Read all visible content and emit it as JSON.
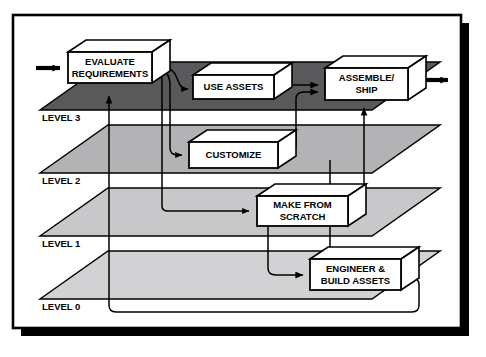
{
  "diagram": {
    "frame": {
      "x": 13,
      "y": 15,
      "width": 448,
      "height": 313,
      "border_color": "#000000",
      "shadow_color": "#000000",
      "fill_color": "#ffffff"
    },
    "colors": {
      "ink": "#000000",
      "paper": "#ffffff",
      "level3_plane": "#59595b",
      "level2_plane": "#b3b3b5",
      "level1_plane": "#c8c8ca",
      "level0_plane": "#d2d2d4",
      "box_face": "#ffffff"
    },
    "levels": [
      {
        "id": "level-3",
        "label": "LEVEL 3",
        "label_x": 42,
        "label_y": 118,
        "plane_fill": "#59595b",
        "plane_points": "40,110 108,62 440,62 372,110"
      },
      {
        "id": "level-2",
        "label": "LEVEL 2",
        "label_x": 42,
        "label_y": 181,
        "plane_fill": "#b3b3b5",
        "plane_points": "40,173 108,125 440,125 372,173"
      },
      {
        "id": "level-1",
        "label": "LEVEL 1",
        "label_x": 42,
        "label_y": 244,
        "plane_fill": "#c8c8ca",
        "plane_points": "40,236 108,188 440,188 372,236"
      },
      {
        "id": "level-0",
        "label": "LEVEL 0",
        "label_x": 42,
        "label_y": 307,
        "plane_fill": "#d2d2d4",
        "plane_points": "40,299 108,251 440,251 372,299"
      }
    ],
    "boxes": [
      {
        "id": "evaluate-requirements",
        "lines": [
          "EVALUATE",
          "REQUIREMENTS"
        ],
        "x": 68,
        "y": 52,
        "width": 84,
        "height": 31,
        "depth_x": 18,
        "depth_y": -12,
        "font_size": 9.5,
        "level": "level-3"
      },
      {
        "id": "use-assets",
        "lines": [
          "USE ASSETS"
        ],
        "x": 193,
        "y": 75,
        "width": 81,
        "height": 24,
        "depth_x": 18,
        "depth_y": -12,
        "font_size": 9.5,
        "level": "level-3"
      },
      {
        "id": "assemble-ship",
        "lines": [
          "ASSEMBLE/",
          "SHIP"
        ],
        "x": 325,
        "y": 68,
        "width": 83,
        "height": 32,
        "depth_x": 18,
        "depth_y": -12,
        "font_size": 9.5,
        "level": "level-3"
      },
      {
        "id": "customize",
        "lines": [
          "CUSTOMIZE"
        ],
        "x": 189,
        "y": 142,
        "width": 89,
        "height": 26,
        "depth_x": 18,
        "depth_y": -12,
        "font_size": 9.5,
        "level": "level-2"
      },
      {
        "id": "make-from-scratch",
        "lines": [
          "MAKE FROM",
          "SCRATCH"
        ],
        "x": 257,
        "y": 196,
        "width": 91,
        "height": 30,
        "depth_x": 18,
        "depth_y": -12,
        "font_size": 9.5,
        "level": "level-1"
      },
      {
        "id": "engineer-build-assets",
        "lines": [
          "ENGINEER &",
          "BUILD ASSETS"
        ],
        "x": 310,
        "y": 259,
        "width": 91,
        "height": 31,
        "depth_x": 18,
        "depth_y": -12,
        "font_size": 9.5,
        "level": "level-0"
      }
    ],
    "connectors": [
      {
        "id": "input-arrow-to-evaluate",
        "kind": "entry-arrow"
      },
      {
        "id": "evaluate-to-use-assets",
        "kind": "branch-arrow"
      },
      {
        "id": "evaluate-to-customize",
        "kind": "branch-arrow"
      },
      {
        "id": "evaluate-to-make-from-scratch",
        "kind": "branch-arrow"
      },
      {
        "id": "use-assets-to-assemble-ship",
        "kind": "flow-arrow"
      },
      {
        "id": "customize-to-assemble-ship",
        "kind": "flow-arrow"
      },
      {
        "id": "make-from-scratch-to-assemble-ship",
        "kind": "flow-arrow"
      },
      {
        "id": "make-from-scratch-to-engineer-build",
        "kind": "flow-arrow"
      },
      {
        "id": "engineer-build-to-assemble-ship",
        "kind": "flow-arrow"
      },
      {
        "id": "engineer-build-feedback-to-evaluate",
        "kind": "feedback-loop"
      },
      {
        "id": "assemble-ship-output-arrow",
        "kind": "exit-arrow"
      }
    ]
  }
}
